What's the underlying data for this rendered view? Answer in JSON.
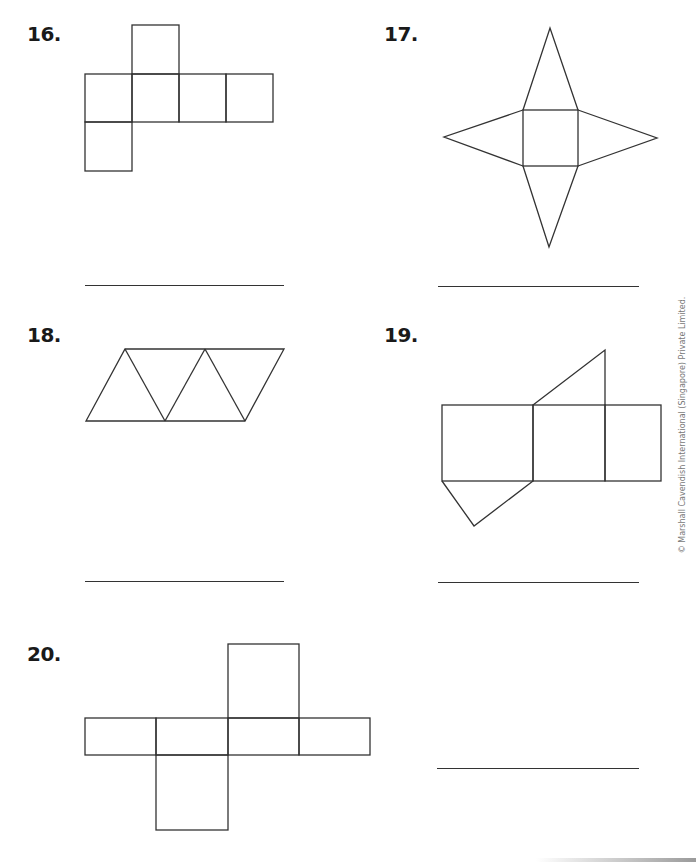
{
  "questions": [
    {
      "number": "16.",
      "figure": "cube-net-6-squares"
    },
    {
      "number": "17.",
      "figure": "square-pyramid-net"
    },
    {
      "number": "18.",
      "figure": "triangular-pyramid-net-4-triangles"
    },
    {
      "number": "19.",
      "figure": "triangular-prism-net"
    },
    {
      "number": "20.",
      "figure": "rectangular-prism-net"
    }
  ],
  "copyright": "© Marshall Cavendish International (Singapore) Private Limited.",
  "colors": {
    "line": "#333333",
    "text": "#1a1a1a"
  }
}
